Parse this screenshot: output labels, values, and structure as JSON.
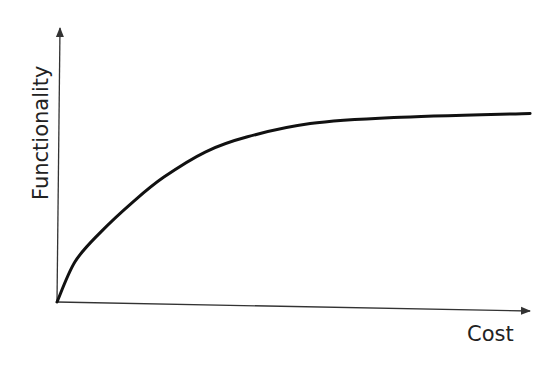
{
  "chart_data": {
    "type": "line",
    "title": "",
    "xlabel": "Cost",
    "ylabel": "Functionality",
    "xlim": [
      0,
      100
    ],
    "ylim": [
      0,
      100
    ],
    "grid": false,
    "legend": "none",
    "ticks": false,
    "series": [
      {
        "name": "Functionality vs Cost",
        "x": [
          0,
          3.8,
          9.3,
          15.9,
          22.5,
          31.3,
          40.1,
          53.3,
          70.9,
          99.6
        ],
        "y": [
          0,
          14.7,
          25.7,
          36.4,
          45.6,
          54.8,
          60.3,
          65.1,
          67.3,
          68.8
        ]
      }
    ],
    "colors": {
      "curve": "#111111",
      "axis": "#333333",
      "text": "#222222"
    }
  }
}
